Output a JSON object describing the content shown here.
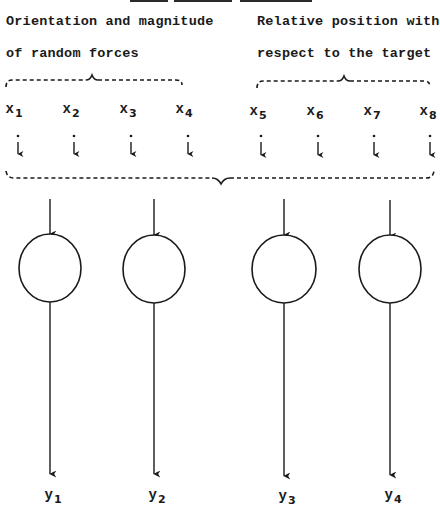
{
  "group_labels": {
    "left": {
      "line1": "Orientation and magnitude",
      "line2": "of random forces"
    },
    "right": {
      "line1": "Relative position with",
      "line2": "respect to the target"
    }
  },
  "inputs": [
    {
      "name": "x",
      "sub": "1"
    },
    {
      "name": "x",
      "sub": "2"
    },
    {
      "name": "x",
      "sub": "3"
    },
    {
      "name": "x",
      "sub": "4"
    },
    {
      "name": "x",
      "sub": "5"
    },
    {
      "name": "x",
      "sub": "6"
    },
    {
      "name": "x",
      "sub": "7"
    },
    {
      "name": "x",
      "sub": "8"
    }
  ],
  "outputs": [
    {
      "name": "y",
      "sub": "1"
    },
    {
      "name": "y",
      "sub": "2"
    },
    {
      "name": "y",
      "sub": "3"
    },
    {
      "name": "y",
      "sub": "4"
    }
  ],
  "colors": {
    "ink": "#1a1a1a",
    "background": "#ffffff"
  }
}
